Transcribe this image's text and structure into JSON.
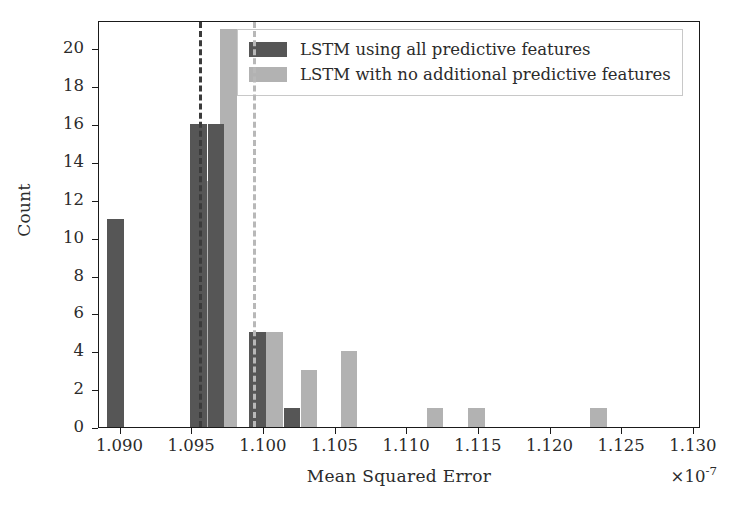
{
  "chart_data": {
    "type": "bar",
    "title": "",
    "subtitle": "",
    "xlabel": "Mean Squared Error",
    "ylabel": "Count",
    "x_multiplier": "×10⁻⁷",
    "x_multiplier_base": "×10",
    "x_multiplier_exp": "-7",
    "xlim": [
      1.0885,
      1.1305
    ],
    "ylim": [
      0,
      21.5
    ],
    "xticks": [
      1.09,
      1.095,
      1.1,
      1.105,
      1.11,
      1.115,
      1.12,
      1.125,
      1.13
    ],
    "xticklabels": [
      "1.090",
      "1.095",
      "1.100",
      "1.105",
      "1.110",
      "1.115",
      "1.120",
      "1.125",
      "1.130"
    ],
    "yticks": [
      0,
      2,
      4,
      6,
      8,
      10,
      12,
      14,
      16,
      18,
      20
    ],
    "yticklabels": [
      "0",
      "2",
      "4",
      "6",
      "8",
      "10",
      "12",
      "14",
      "16",
      "18",
      "20"
    ],
    "grid": false,
    "legend_position": "upper center",
    "bin_width": 0.00115,
    "series": [
      {
        "name": "LSTM using all predictive features",
        "color": "#565656",
        "bars": [
          {
            "x": 1.08965,
            "value": 11
          },
          {
            "x": 1.09545,
            "value": 16
          },
          {
            "x": 1.09665,
            "value": 16
          },
          {
            "x": 1.09955,
            "value": 5
          },
          {
            "x": 1.10195,
            "value": 1
          }
        ]
      },
      {
        "name": "LSTM with no additional predictive features",
        "color": "#b2b2b2",
        "bars": [
          {
            "x": 1.09615,
            "value": 13
          },
          {
            "x": 1.09755,
            "value": 21
          },
          {
            "x": 1.10075,
            "value": 5
          },
          {
            "x": 1.10315,
            "value": 3
          },
          {
            "x": 1.10595,
            "value": 4
          },
          {
            "x": 1.11195,
            "value": 1
          },
          {
            "x": 1.11485,
            "value": 1
          },
          {
            "x": 1.12335,
            "value": 1
          }
        ]
      }
    ],
    "vertical_lines": [
      {
        "name": "mean-all-features",
        "x": 1.09545,
        "color": "#3b3b3b",
        "style": "dashed"
      },
      {
        "name": "mean-no-additional-features",
        "x": 1.09925,
        "color": "#b8b8b8",
        "style": "dashed"
      }
    ],
    "legend": [
      {
        "label": "LSTM using all predictive features",
        "color": "#565656"
      },
      {
        "label": "LSTM with no additional predictive features",
        "color": "#b2b2b2"
      }
    ]
  }
}
